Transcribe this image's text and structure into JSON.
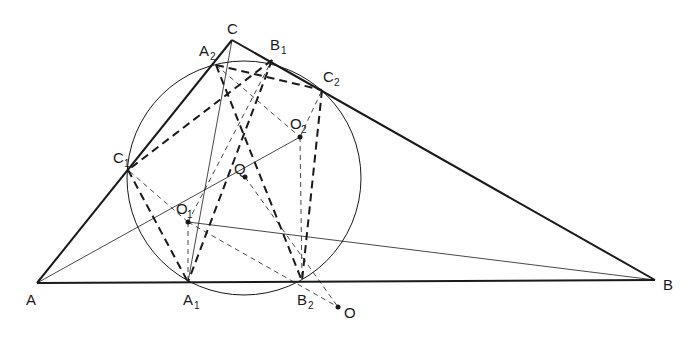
{
  "diagram": {
    "colors": {
      "stroke": "#1a1a1a",
      "background": "#ffffff"
    },
    "points": {
      "A": {
        "x": 37,
        "y": 283,
        "label": "A",
        "sub": ""
      },
      "B": {
        "x": 655,
        "y": 280,
        "label": "B",
        "sub": ""
      },
      "C": {
        "x": 232,
        "y": 40,
        "label": "C",
        "sub": ""
      },
      "A1": {
        "x": 188,
        "y": 282,
        "label": "A",
        "sub": "1"
      },
      "A2": {
        "x": 216,
        "y": 65,
        "label": "A",
        "sub": "2"
      },
      "B1": {
        "x": 272,
        "y": 60,
        "label": "B",
        "sub": "1"
      },
      "B2": {
        "x": 302,
        "y": 281,
        "label": "B",
        "sub": "2"
      },
      "C1": {
        "x": 128,
        "y": 170,
        "label": "C",
        "sub": "1"
      },
      "C2": {
        "x": 322,
        "y": 90,
        "label": "C",
        "sub": "2"
      },
      "O1": {
        "x": 188,
        "y": 222,
        "label": "O",
        "sub": "1"
      },
      "O2": {
        "x": 300,
        "y": 137,
        "label": "O",
        "sub": "2"
      },
      "Q": {
        "x": 245,
        "y": 177,
        "label": "Q",
        "sub": ""
      },
      "O": {
        "x": 338,
        "y": 307,
        "label": "O",
        "sub": ""
      }
    },
    "circle": {
      "cx": 244,
      "cy": 178,
      "r": 117
    },
    "labels": {
      "A": "A",
      "B": "B",
      "C": "C",
      "A1": "A",
      "A1_sub": "1",
      "A2": "A",
      "A2_sub": "2",
      "B1": "B",
      "B1_sub": "1",
      "B2": "B",
      "B2_sub": "2",
      "C1": "C",
      "C1_sub": "1",
      "C2": "C",
      "C2_sub": "2",
      "O1": "O",
      "O1_sub": "1",
      "O2": "O",
      "O2_sub": "2",
      "Q": "Q",
      "O": "O"
    },
    "segments": {
      "triangle_sides": [
        "A-B",
        "B-C",
        "C-A"
      ],
      "bold_dashed": [
        "A2-B2",
        "A2-C2",
        "B1-C1",
        "B1-A1",
        "C1-A1",
        "C2-B2",
        "C1-B2",
        "A2-O1"
      ],
      "thin_solid": [
        "A-O2",
        "O1-B",
        "C-A1",
        "O1-B2"
      ],
      "thin_dashed": [
        "O1-A1",
        "O1-C1",
        "O2-B2",
        "O2-C2",
        "A2-O2",
        "O1-B1",
        "O1-O",
        "Q-B2"
      ]
    }
  }
}
